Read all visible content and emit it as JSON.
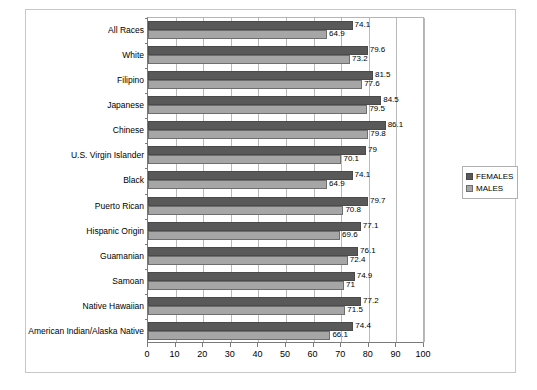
{
  "chart_data": {
    "type": "bar",
    "orientation": "horizontal",
    "title": "",
    "xlabel": "",
    "ylabel": "",
    "xlim": [
      0,
      100
    ],
    "xticks": [
      0,
      10,
      20,
      30,
      40,
      50,
      60,
      70,
      80,
      90,
      100
    ],
    "grid": true,
    "legend_position": "right",
    "categories": [
      "All Races",
      "White",
      "Filipino",
      "Japanese",
      "Chinese",
      "U.S. Virgin Islander",
      "Black",
      "Puerto Rican",
      "Hispanic Origin",
      "Guamanian",
      "Samoan",
      "Native Hawaiian",
      "American Indian/Alaska Native"
    ],
    "series": [
      {
        "name": "FEMALES",
        "color": "#595959",
        "values": [
          74.1,
          79.6,
          81.5,
          84.5,
          86.1,
          79,
          74.1,
          79.7,
          77.1,
          76.1,
          74.9,
          77.2,
          74.4
        ],
        "labels": [
          "74.1",
          "79.6",
          "81.5",
          "84.5",
          "86.1",
          "79",
          "74.1",
          "79.7",
          "77.1",
          "76.1",
          "74.9",
          "77.2",
          "74.4"
        ]
      },
      {
        "name": "MALES",
        "color": "#a6a6a6",
        "values": [
          64.9,
          73.2,
          77.6,
          79.5,
          79.8,
          70.1,
          64.9,
          70.8,
          69.6,
          72.4,
          71,
          71.5,
          66.1
        ],
        "labels": [
          "64.9",
          "73.2",
          "77.6",
          "79.5",
          "79.8",
          "70.1",
          "64.9",
          "70.8",
          "69.6",
          "72.4",
          "71",
          "71.5",
          "66.1"
        ]
      }
    ]
  },
  "legend": {
    "items": [
      {
        "label": "FEMALES",
        "color": "#595959"
      },
      {
        "label": "MALES",
        "color": "#a6a6a6"
      }
    ]
  }
}
